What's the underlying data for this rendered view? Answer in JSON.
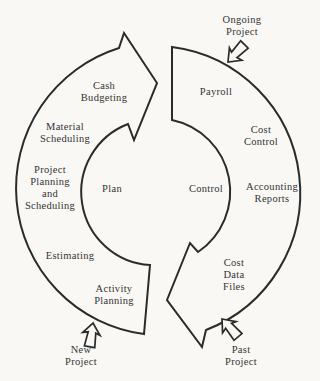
{
  "diagram": {
    "background_color": "#f9f8f4",
    "line_color": "#2b2b2b",
    "text_color": "#343434",
    "plan_cycle": {
      "center_label": "Plan",
      "items": [
        {
          "label": "Cash\nBudgeting"
        },
        {
          "label": "Material\nScheduling"
        },
        {
          "label": "Project\nPlanning\nand\nScheduling"
        },
        {
          "label": "Estimating"
        },
        {
          "label": "Activity\nPlanning"
        }
      ]
    },
    "control_cycle": {
      "center_label": "Control",
      "items": [
        {
          "label": "Payroll"
        },
        {
          "label": "Cost\nControl"
        },
        {
          "label": "Accounting\nReports"
        },
        {
          "label": "Cost\nData\nFiles"
        }
      ]
    },
    "external": {
      "ongoing_project": "Ongoing\nProject",
      "new_project": "New\nProject",
      "past_project": "Past\nProject"
    }
  }
}
